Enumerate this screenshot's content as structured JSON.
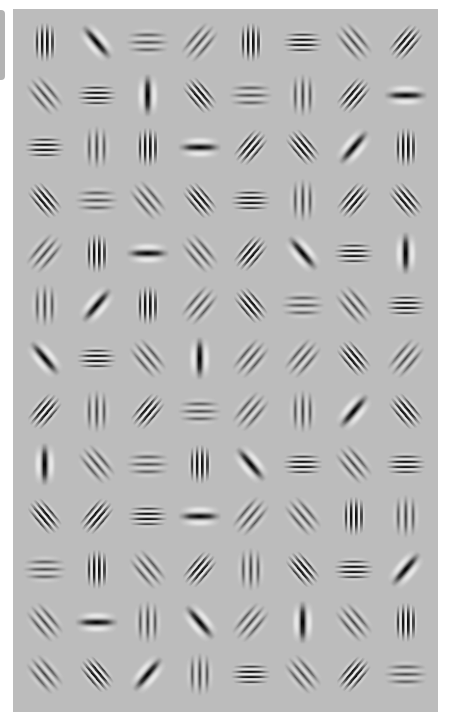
{
  "figure": {
    "title": "",
    "rows": 13,
    "columns": 8,
    "background_color": "#bcbcbc",
    "legend": {
      "V": "vertical stripes",
      "H": "horizontal stripes",
      "D1": "diagonal stripes (\\)",
      "D2": "diagonal stripes (/)",
      "high": "high spatial frequency (many thin stripes)",
      "med": "medium spatial frequency",
      "blob": "low spatial frequency (single dark lobe)"
    },
    "filters": [
      [
        [
          "V",
          "high"
        ],
        [
          "D1",
          "blob"
        ],
        [
          "H",
          "med"
        ],
        [
          "D2",
          "med"
        ],
        [
          "V",
          "high"
        ],
        [
          "H",
          "high"
        ],
        [
          "D1",
          "med"
        ],
        [
          "D2",
          "high"
        ]
      ],
      [
        [
          "D1",
          "med"
        ],
        [
          "H",
          "high"
        ],
        [
          "V",
          "blob"
        ],
        [
          "D1",
          "high"
        ],
        [
          "H",
          "med"
        ],
        [
          "V",
          "med"
        ],
        [
          "D2",
          "high"
        ],
        [
          "H",
          "blob"
        ]
      ],
      [
        [
          "H",
          "high"
        ],
        [
          "V",
          "med"
        ],
        [
          "V",
          "high"
        ],
        [
          "H",
          "blob"
        ],
        [
          "D2",
          "high"
        ],
        [
          "D1",
          "high"
        ],
        [
          "D2",
          "blob"
        ],
        [
          "V",
          "high"
        ]
      ],
      [
        [
          "D1",
          "high"
        ],
        [
          "H",
          "med"
        ],
        [
          "D1",
          "med"
        ],
        [
          "D1",
          "high"
        ],
        [
          "H",
          "high"
        ],
        [
          "V",
          "med"
        ],
        [
          "D2",
          "high"
        ],
        [
          "D1",
          "high"
        ]
      ],
      [
        [
          "D2",
          "med"
        ],
        [
          "V",
          "high"
        ],
        [
          "H",
          "blob"
        ],
        [
          "D1",
          "med"
        ],
        [
          "D2",
          "high"
        ],
        [
          "D1",
          "blob"
        ],
        [
          "H",
          "high"
        ],
        [
          "V",
          "blob"
        ]
      ],
      [
        [
          "V",
          "med"
        ],
        [
          "D2",
          "blob"
        ],
        [
          "V",
          "high"
        ],
        [
          "D2",
          "med"
        ],
        [
          "D1",
          "high"
        ],
        [
          "H",
          "med"
        ],
        [
          "D1",
          "med"
        ],
        [
          "H",
          "high"
        ]
      ],
      [
        [
          "D1",
          "blob"
        ],
        [
          "H",
          "high"
        ],
        [
          "D1",
          "med"
        ],
        [
          "V",
          "blob"
        ],
        [
          "D2",
          "med"
        ],
        [
          "D2",
          "med"
        ],
        [
          "D1",
          "high"
        ],
        [
          "D2",
          "med"
        ]
      ],
      [
        [
          "D2",
          "high"
        ],
        [
          "V",
          "med"
        ],
        [
          "D2",
          "high"
        ],
        [
          "H",
          "med"
        ],
        [
          "D2",
          "med"
        ],
        [
          "V",
          "med"
        ],
        [
          "D2",
          "blob"
        ],
        [
          "D1",
          "high"
        ]
      ],
      [
        [
          "V",
          "blob"
        ],
        [
          "D1",
          "med"
        ],
        [
          "H",
          "med"
        ],
        [
          "V",
          "high"
        ],
        [
          "D1",
          "blob"
        ],
        [
          "H",
          "high"
        ],
        [
          "D1",
          "med"
        ],
        [
          "H",
          "high"
        ]
      ],
      [
        [
          "D1",
          "high"
        ],
        [
          "D2",
          "high"
        ],
        [
          "H",
          "high"
        ],
        [
          "H",
          "blob"
        ],
        [
          "D2",
          "med"
        ],
        [
          "D1",
          "med"
        ],
        [
          "V",
          "high"
        ],
        [
          "V",
          "med"
        ]
      ],
      [
        [
          "H",
          "med"
        ],
        [
          "V",
          "high"
        ],
        [
          "D1",
          "med"
        ],
        [
          "D2",
          "high"
        ],
        [
          "V",
          "med"
        ],
        [
          "D1",
          "high"
        ],
        [
          "H",
          "high"
        ],
        [
          "D2",
          "blob"
        ]
      ],
      [
        [
          "D1",
          "med"
        ],
        [
          "H",
          "blob"
        ],
        [
          "V",
          "med"
        ],
        [
          "D1",
          "blob"
        ],
        [
          "D2",
          "med"
        ],
        [
          "V",
          "blob"
        ],
        [
          "D1",
          "med"
        ],
        [
          "V",
          "high"
        ]
      ],
      [
        [
          "D1",
          "med"
        ],
        [
          "D1",
          "high"
        ],
        [
          "D2",
          "blob"
        ],
        [
          "V",
          "med"
        ],
        [
          "H",
          "high"
        ],
        [
          "D1",
          "med"
        ],
        [
          "D2",
          "high"
        ],
        [
          "H",
          "med"
        ]
      ]
    ]
  }
}
